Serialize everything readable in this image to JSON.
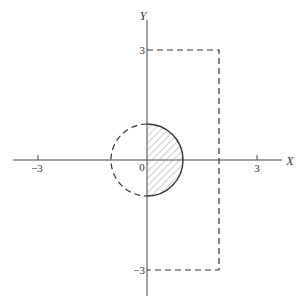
{
  "diagram": {
    "axes": {
      "x_label": "X",
      "y_label": "Y",
      "origin_label": "0",
      "x_ticks": [
        {
          "value": -3,
          "label": "−3"
        },
        {
          "value": 3,
          "label": "3"
        }
      ],
      "y_ticks": [
        {
          "value": 3,
          "label": "3"
        },
        {
          "value": -3,
          "label": "−3"
        }
      ]
    },
    "shapes": [
      {
        "name": "dashed-rectangle",
        "style": "dashed",
        "x_range": [
          0,
          2
        ],
        "y_range": [
          -3,
          3
        ]
      },
      {
        "name": "circle",
        "center": [
          0,
          0
        ],
        "radius": 1,
        "left_half_style": "dashed",
        "right_half_style": "solid",
        "right_half_fill": "hatched"
      }
    ],
    "colors": {
      "line": "#333333",
      "hatch": "#777777",
      "background": "#ffffff"
    }
  }
}
